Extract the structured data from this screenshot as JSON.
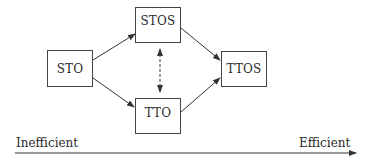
{
  "diagram": {
    "nodes": [
      {
        "id": "sto",
        "label": "STO"
      },
      {
        "id": "stos",
        "label": "STOS"
      },
      {
        "id": "tto",
        "label": "TTO"
      },
      {
        "id": "ttos",
        "label": "TTOS"
      }
    ],
    "edges": [
      {
        "from": "STO",
        "to": "STOS",
        "style": "solid-arrow"
      },
      {
        "from": "STO",
        "to": "TTO",
        "style": "solid-arrow"
      },
      {
        "from": "STOS",
        "to": "TTOS",
        "style": "solid-arrow"
      },
      {
        "from": "TTO",
        "to": "TTOS",
        "style": "solid-arrow"
      },
      {
        "from": "STOS",
        "to": "TTO",
        "style": "dashed-double-arrow"
      }
    ],
    "axis": {
      "left_label": "Inefficient",
      "right_label": "Efficient"
    }
  }
}
